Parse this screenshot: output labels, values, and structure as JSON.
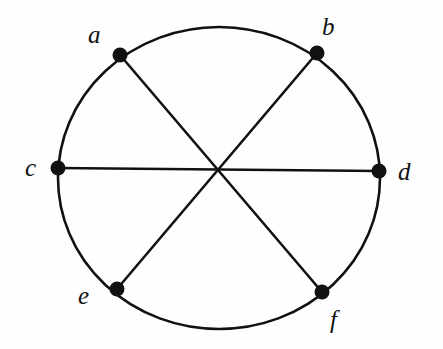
{
  "figure": {
    "kind": "geometry-diagram",
    "width": 443,
    "height": 349,
    "background_color": "#fefefe",
    "ink_color": "#111111"
  },
  "chart_data": {
    "type": "diagram",
    "title": "",
    "xlabel": "",
    "ylabel": "",
    "grid": false,
    "legend": "none",
    "circle": {
      "center_x": 219,
      "center_y": 178,
      "radius_x": 161,
      "radius_y": 151,
      "stroke_width": 2.6,
      "stroke_color": "#111111",
      "fill": "none"
    },
    "points": [
      {
        "label": "a",
        "x": 120,
        "y": 55,
        "label_x": 88,
        "label_y": 22,
        "marker": "filled-circle",
        "marker_radius": 7.5
      },
      {
        "label": "b",
        "x": 317,
        "y": 53,
        "label_x": 322,
        "label_y": 14,
        "marker": "filled-circle",
        "marker_radius": 7.5
      },
      {
        "label": "c",
        "x": 58,
        "y": 168,
        "label_x": 25,
        "label_y": 155,
        "marker": "filled-circle",
        "marker_radius": 7.5
      },
      {
        "label": "d",
        "x": 379,
        "y": 171,
        "label_x": 398,
        "label_y": 159,
        "marker": "filled-circle",
        "marker_radius": 7.5
      },
      {
        "label": "e",
        "x": 117,
        "y": 289,
        "label_x": 78,
        "label_y": 283,
        "marker": "filled-circle",
        "marker_radius": 7.5
      },
      {
        "label": "f",
        "x": 322,
        "y": 292,
        "label_x": 330,
        "label_y": 307,
        "marker": "filled-circle",
        "marker_radius": 7.5
      }
    ],
    "chords": [
      {
        "name": "diameter-a-f",
        "from": "a",
        "to": "f",
        "x1": 120,
        "y1": 55,
        "x2": 322,
        "y2": 292,
        "stroke_width": 2.6
      },
      {
        "name": "diameter-b-e",
        "from": "b",
        "to": "e",
        "x1": 317,
        "y1": 53,
        "x2": 117,
        "y2": 289,
        "stroke_width": 2.6
      },
      {
        "name": "diameter-c-d",
        "from": "c",
        "to": "d",
        "x1": 58,
        "y1": 168,
        "x2": 379,
        "y2": 171,
        "stroke_width": 2.6
      }
    ],
    "intersection": {
      "name": "center-crossing",
      "x": 220,
      "y": 170
    }
  }
}
